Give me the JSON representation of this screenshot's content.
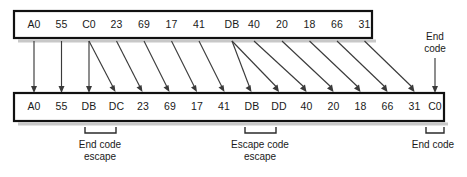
{
  "diagram": {
    "input_row": {
      "name": "original-frame",
      "cells": [
        "A0",
        "55",
        "C0",
        "23",
        "69",
        "17",
        "41",
        "DB",
        "40",
        "20",
        "18",
        "66",
        "31"
      ]
    },
    "output_row": {
      "name": "stuffed-frame",
      "cells": [
        "A0",
        "55",
        "DB",
        "DC",
        "23",
        "69",
        "17",
        "41",
        "DB",
        "DD",
        "40",
        "20",
        "18",
        "66",
        "31",
        "C0"
      ]
    },
    "annotations": {
      "top_right": {
        "line1": "End",
        "line2": "code"
      },
      "bottom_left": {
        "line1": "End code",
        "line2": "escape"
      },
      "bottom_middle": {
        "line1": "Escape code",
        "line2": "escape"
      },
      "bottom_right": {
        "line1": "End code",
        "line2": ""
      }
    },
    "colors": {
      "background": "#ffffff",
      "box_border": "#111111",
      "text": "#1a1a1a",
      "connector": "#3a3a3a",
      "bracket": "#2b2b2b",
      "shadow": "#9a9a9a"
    }
  }
}
